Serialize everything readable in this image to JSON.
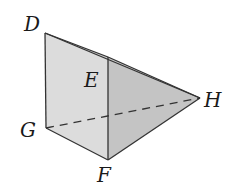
{
  "diagram": {
    "type": "3d-solid-pyramid-prism",
    "colors": {
      "left_face": "#dcdcdc",
      "right_face": "#c4c4c4",
      "edge": "#333333",
      "background": "#ffffff"
    },
    "vertices": {
      "D": {
        "label": "D",
        "x": 45,
        "y": 33
      },
      "E": {
        "label": "E",
        "x": 108,
        "y": 57
      },
      "H": {
        "label": "H",
        "x": 200,
        "y": 98
      },
      "G": {
        "label": "G",
        "x": 46,
        "y": 128
      },
      "F": {
        "label": "F",
        "x": 108,
        "y": 160
      }
    },
    "labels": {
      "D": "D",
      "E": "E",
      "H": "H",
      "G": "G",
      "F": "F"
    },
    "edges": {
      "solid": [
        "D-E",
        "D-H",
        "E-H",
        "E-F",
        "F-H",
        "D-G",
        "G-F"
      ],
      "dashed": [
        "G-H"
      ]
    }
  }
}
